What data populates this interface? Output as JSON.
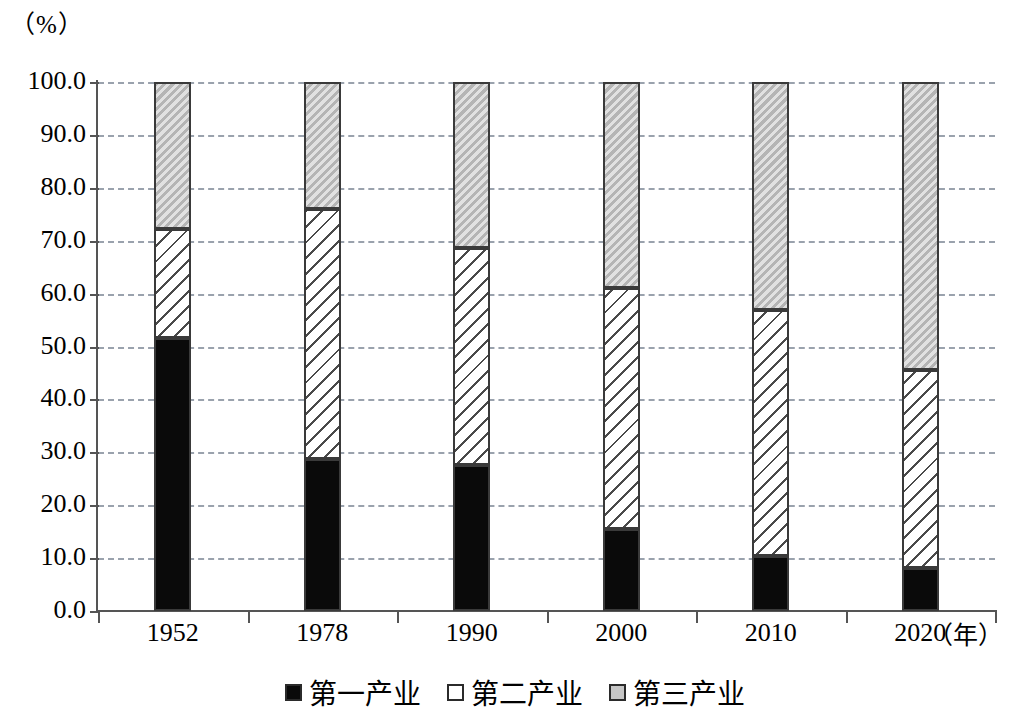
{
  "chart_data": {
    "type": "bar",
    "stacked": true,
    "stack_mode": "percent",
    "title": "",
    "subtitle": "",
    "xlabel": "（年）",
    "ylabel": "（%）",
    "categories": [
      "1952",
      "1978",
      "1990",
      "2000",
      "2010",
      "2020"
    ],
    "series": [
      {
        "name": "第一产业",
        "key": "primary",
        "color": "#0a0a0a",
        "pattern": "solid-black",
        "values": [
          51.7,
          28.7,
          27.6,
          15.5,
          10.4,
          8.1
        ]
      },
      {
        "name": "第二产业",
        "key": "secondary",
        "color": "#ffffff",
        "pattern": "diagonal-hatch",
        "values": [
          20.5,
          47.3,
          41.0,
          45.6,
          46.5,
          37.4
        ]
      },
      {
        "name": "第三产业",
        "key": "tertiary",
        "color": "#c9c9c9",
        "pattern": "light-gray",
        "values": [
          27.8,
          24.0,
          31.4,
          38.9,
          43.1,
          54.5
        ]
      }
    ],
    "cumulative_tops": [
      {
        "category": "1952",
        "primary_top": 51.7,
        "secondary_top": 72.2,
        "total": 100.0
      },
      {
        "category": "1978",
        "primary_top": 28.7,
        "secondary_top": 76.0,
        "total": 100.0
      },
      {
        "category": "1990",
        "primary_top": 27.6,
        "secondary_top": 68.6,
        "total": 100.0
      },
      {
        "category": "2000",
        "primary_top": 15.5,
        "secondary_top": 61.1,
        "total": 100.0
      },
      {
        "category": "2010",
        "primary_top": 10.4,
        "secondary_top": 56.9,
        "total": 100.0
      },
      {
        "category": "2020",
        "primary_top": 8.1,
        "secondary_top": 45.5,
        "total": 100.0
      }
    ],
    "ylim": [
      0.0,
      100.0
    ],
    "ytick_step": 10.0,
    "yticks": [
      "100.0",
      "90.0",
      "80.0",
      "70.0",
      "60.0",
      "50.0",
      "40.0",
      "30.0",
      "20.0",
      "10.0",
      "0.0"
    ],
    "grid": "horizontal-dashed",
    "grid_color": "#9aa2ad",
    "legend_position": "bottom-center",
    "legend": [
      "第一产业",
      "第二产业",
      "第三产业"
    ]
  },
  "axes": {
    "y_unit_label": "（%）",
    "x_unit_label": "（年）"
  }
}
